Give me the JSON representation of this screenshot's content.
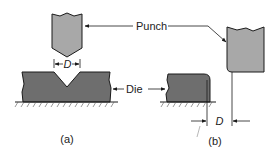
{
  "diagram": {
    "labels": {
      "punch": "Punch",
      "die": "Die",
      "dimension": "D",
      "panel_a": "(a)",
      "panel_b": "(b)"
    },
    "colors": {
      "punch_fill": "#a8a8a8",
      "die_fill": "#6e6e6e",
      "stroke": "#1a1a1a",
      "background": "#ffffff"
    }
  }
}
